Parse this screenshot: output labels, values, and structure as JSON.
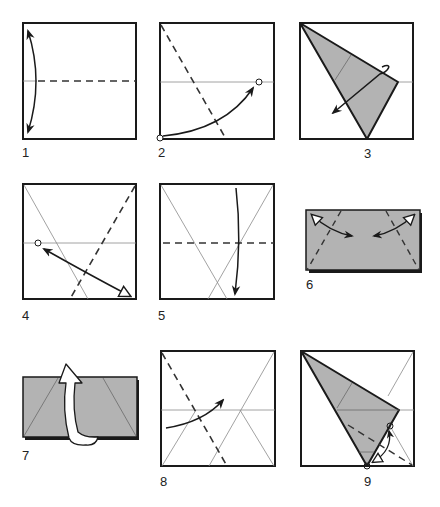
{
  "figure": {
    "type": "origami-step-diagram",
    "colors": {
      "paper_outline": "#1a1a1a",
      "paper_fill_colored": "#b3b3b3",
      "crease_line": "#8a8a8a",
      "arrow": "#1a1a1a",
      "background": "#ffffff"
    },
    "steps": [
      {
        "id": 1,
        "label": "1",
        "content": "square with horizontal valley-fold dashed line at middle; curved two-way arrow along left edge (fold and unfold)"
      },
      {
        "id": 2,
        "label": "2",
        "content": "square with horizontal crease; diagonal dashed fold line from top-left toward bottom; circle at bottom-left corner, arrow to circle on horizontal crease near right edge"
      },
      {
        "id": 3,
        "label": "3",
        "content": "square with shaded folded triangle flap from top-left; curved arrow indicating unfold"
      },
      {
        "id": 4,
        "label": "4",
        "content": "square with crease lines; dashed fold from top-right toward bottom; circle on left at horizontal crease with two-way arrow to bottom-right corner"
      },
      {
        "id": 5,
        "label": "5",
        "content": "square with two crossing diagonal creases; horizontal dashed fold line at middle; downward arrow"
      },
      {
        "id": 6,
        "label": "6",
        "content": "shaded rectangle with two slanted dashed fold lines and two-way arrows at top corners"
      },
      {
        "id": 7,
        "label": "7",
        "content": "shaded rectangle with crease lines; large hollow turn-over arrow"
      },
      {
        "id": 8,
        "label": "8",
        "content": "square with crease lines; dashed diagonal fold from top-left; curved arrow toward right"
      },
      {
        "id": 9,
        "label": "9",
        "content": "square with shaded folded triangle flap from top-left; dashed line and small two-way arrow near bottom"
      }
    ]
  }
}
